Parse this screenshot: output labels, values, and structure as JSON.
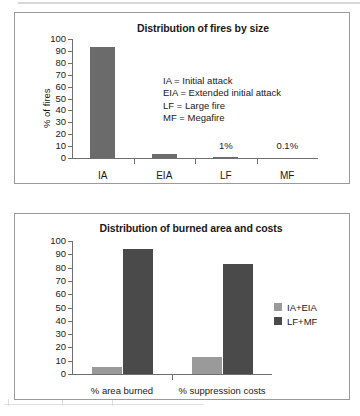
{
  "figure": {
    "background": "#ffffff",
    "panel_border": "#9a9a9a"
  },
  "colors": {
    "bar_dark": "#4a4a4a",
    "bar_mid": "#6b6b6b",
    "bar_light": "#9a9a9a",
    "axis": "#6f6f6f",
    "text": "#1a1a1a"
  },
  "chart_data": [
    {
      "type": "bar",
      "id": "fires-by-size",
      "title": "Distribution of fires by size",
      "xlabel": "",
      "ylabel": "% of fires",
      "ylim": [
        0,
        100
      ],
      "yticks": [
        0,
        10,
        20,
        30,
        40,
        50,
        60,
        70,
        80,
        90,
        100
      ],
      "grid": false,
      "legend": "none",
      "categories": [
        "IA",
        "EIA",
        "LF",
        "MF"
      ],
      "values": [
        93.5,
        3,
        1,
        0.1
      ],
      "bar_color": "#6b6b6b",
      "data_labels": [
        {
          "category": "LF",
          "text": "1%"
        },
        {
          "category": "MF",
          "text": "0.1%"
        }
      ],
      "annotations": [
        "IA = Initial attack",
        "EIA = Extended initial attack",
        "LF = Large fire",
        "MF = Megafire"
      ]
    },
    {
      "type": "bar",
      "id": "burned-area-and-costs",
      "title": "Distribution of burned area and costs",
      "xlabel": "",
      "ylabel": "",
      "ylim": [
        0,
        100
      ],
      "yticks": [
        0,
        10,
        20,
        30,
        40,
        50,
        60,
        70,
        80,
        90,
        100
      ],
      "grid": false,
      "legend": "right",
      "categories": [
        "% area burned",
        "% suppression costs"
      ],
      "series": [
        {
          "name": "IA+EIA",
          "values": [
            5,
            13
          ],
          "color": "#9a9a9a"
        },
        {
          "name": "LF+MF",
          "values": [
            94,
            83
          ],
          "color": "#4a4a4a"
        }
      ]
    }
  ]
}
